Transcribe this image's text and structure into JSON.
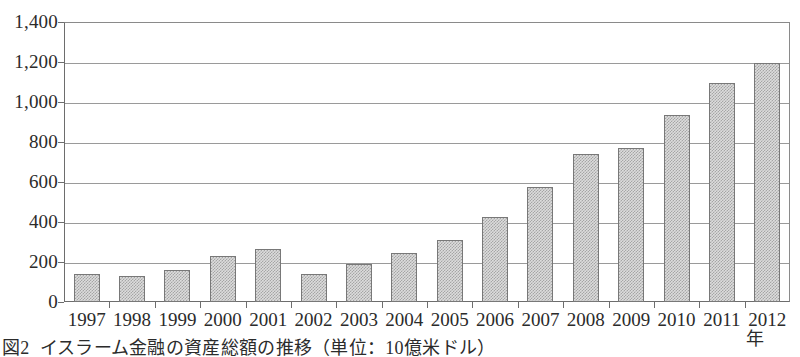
{
  "chart_data": {
    "type": "bar",
    "title": "",
    "caption_label": "図2",
    "caption_text": "イスラーム金融の資産総額の推移（単位：10億米ドル）",
    "xlabel": "年",
    "ylabel": "",
    "categories": [
      "1997",
      "1998",
      "1999",
      "2000",
      "2001",
      "2002",
      "2003",
      "2004",
      "2005",
      "2006",
      "2007",
      "2008",
      "2009",
      "2010",
      "2011",
      "2012"
    ],
    "values": [
      140,
      128,
      162,
      230,
      265,
      140,
      190,
      245,
      310,
      425,
      575,
      740,
      770,
      935,
      1095,
      1195
    ],
    "ylim": [
      0,
      1400
    ],
    "ytick_values": [
      0,
      200,
      400,
      600,
      800,
      1000,
      1200,
      1400
    ],
    "ytick_labels": [
      "0",
      "200",
      "400",
      "600",
      "800",
      "1,000",
      "1,200",
      "1,400"
    ],
    "grid": true,
    "grid_axis": "y",
    "legend": false,
    "bar_fill_color": "#dcdcdc",
    "bar_border_color": "#787878",
    "axis_color": "#6d6d6d",
    "grid_color": "#9a9a9a"
  }
}
